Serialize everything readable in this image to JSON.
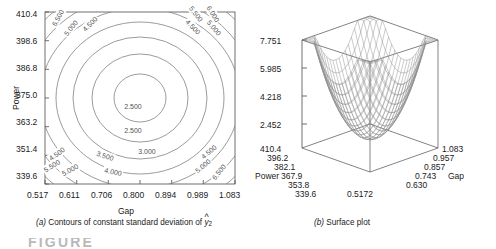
{
  "figure": {
    "panels": [
      {
        "id": "contour",
        "caption_letter": "(a)",
        "caption_text": "Contours of constant standard deviation of",
        "caption_symbol": "y",
        "caption_symbol_sub": "2"
      },
      {
        "id": "surface",
        "caption_letter": "(b)",
        "caption_text": "Surface plot"
      }
    ],
    "figure_strip_text": "FIGURE"
  },
  "chart_data": [
    {
      "type": "contour",
      "title": "Contours of constant standard deviation of yhat_2",
      "xlabel": "Gap",
      "ylabel": "Power",
      "xticks": [
        "0.517",
        "0.611",
        "0.706",
        "0.800",
        "0.894",
        "0.989",
        "1.083"
      ],
      "yticks": [
        "339.6",
        "351.4",
        "363.2",
        "375.0",
        "386.8",
        "398.6",
        "410.4"
      ],
      "xlim": [
        0.517,
        1.083
      ],
      "ylim": [
        339.6,
        410.4
      ],
      "grid": false,
      "legend": "none",
      "contour_levels": [
        2.5,
        3.0,
        3.5,
        4.0,
        4.5,
        5.0,
        5.5,
        6.0,
        6.5
      ],
      "center": {
        "gap": 0.8,
        "power": 375.0,
        "value": 2.3
      },
      "inline_labels": [
        {
          "text": "6.500",
          "x": 58,
          "y": 18,
          "rot": -62
        },
        {
          "text": "5.000",
          "x": 71,
          "y": 28,
          "rot": -52
        },
        {
          "text": "4.500",
          "x": 90,
          "y": 24,
          "rot": -45
        },
        {
          "text": "5.500",
          "x": 196,
          "y": 14,
          "rot": 52
        },
        {
          "text": "6.000",
          "x": 213,
          "y": 14,
          "rot": 58
        },
        {
          "text": "4.500",
          "x": 193,
          "y": 27,
          "rot": 45
        },
        {
          "text": "5.000",
          "x": 214,
          "y": 28,
          "rot": 50
        },
        {
          "text": "2.500",
          "x": 133,
          "y": 107,
          "rot": 0
        },
        {
          "text": "2.500",
          "x": 133,
          "y": 131,
          "rot": 0
        },
        {
          "text": "3.000",
          "x": 147,
          "y": 152,
          "rot": 0
        },
        {
          "text": "3.500",
          "x": 105,
          "y": 156,
          "rot": 18
        },
        {
          "text": "4.000",
          "x": 113,
          "y": 172,
          "rot": 12
        },
        {
          "text": "4.500",
          "x": 57,
          "y": 154,
          "rot": -36
        },
        {
          "text": "5.500",
          "x": 52,
          "y": 166,
          "rot": -32
        },
        {
          "text": "5.000",
          "x": 70,
          "y": 170,
          "rot": -28
        },
        {
          "text": "4.500",
          "x": 209,
          "y": 152,
          "rot": -40
        },
        {
          "text": "5.000",
          "x": 203,
          "y": 166,
          "rot": -40
        },
        {
          "text": "6.500",
          "x": 219,
          "y": 172,
          "rot": -52
        }
      ]
    },
    {
      "type": "surface",
      "title": "Surface plot",
      "zlabel": "",
      "xlabel": "Power",
      "ylabel": "Gap",
      "zticks": [
        "2.452",
        "4.218",
        "5.985",
        "7.751"
      ],
      "zlim": [
        2.452,
        7.751
      ],
      "xticks": [
        "339.6",
        "353.8",
        "367.9",
        "382.1",
        "396.2",
        "410.4"
      ],
      "yticks": [
        "0.5172",
        "0.630",
        "0.743",
        "0.857",
        "0.957",
        "1.083"
      ],
      "xlim": [
        339.6,
        410.4
      ],
      "ylim": [
        0.5172,
        1.083
      ],
      "grid": false,
      "legend": "none",
      "surface_shape": "paraboloid-bowl",
      "mesh": true
    }
  ]
}
